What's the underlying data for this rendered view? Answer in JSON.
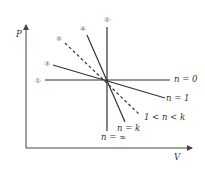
{
  "diagram": {
    "type": "polytropic-process-pv-diagram",
    "axes": {
      "y_label": "P",
      "x_label": "V"
    },
    "center": [
      107,
      80
    ],
    "lines": [
      {
        "id": "1",
        "marker": "①",
        "label": "n = 0",
        "style": "solid",
        "from": [
          45,
          80
        ],
        "to": [
          170,
          80
        ],
        "marker_pos": [
          38,
          80
        ],
        "label_pos": [
          174,
          82
        ]
      },
      {
        "id": "2",
        "marker": "②",
        "label": "n = ∞",
        "style": "solid",
        "from": [
          107,
          27
        ],
        "to": [
          107,
          131
        ],
        "marker_pos": [
          107,
          19
        ],
        "label_pos": [
          101,
          140
        ]
      },
      {
        "id": "3",
        "marker": "③",
        "label": "n = 1",
        "style": "solid",
        "from": [
          53,
          65
        ],
        "to": [
          165,
          98
        ],
        "marker_pos": [
          47,
          63
        ],
        "label_pos": [
          166,
          101
        ]
      },
      {
        "id": "4",
        "marker": "④",
        "label": "n = k",
        "style": "solid",
        "from": [
          87,
          35
        ],
        "to": [
          125,
          122
        ],
        "marker_pos": [
          83,
          28
        ],
        "label_pos": [
          117,
          131
        ]
      },
      {
        "id": "5",
        "marker": "⑤",
        "label": "1 < n < k",
        "style": "dashed",
        "from": [
          65,
          43
        ],
        "to": [
          140,
          115
        ],
        "marker_pos": [
          59,
          38
        ],
        "label_pos": [
          144,
          120
        ]
      }
    ]
  }
}
